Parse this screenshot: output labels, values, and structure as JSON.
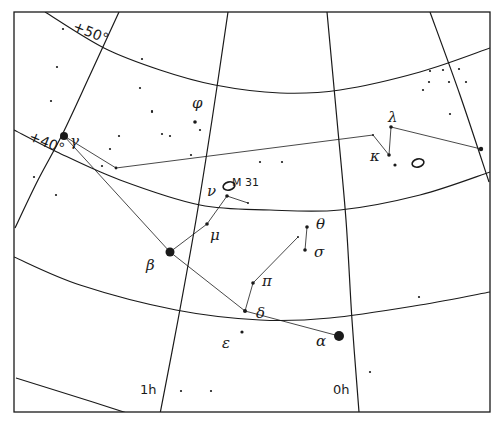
{
  "colors": {
    "ink": "#1a1a1a",
    "background": "#ffffff"
  },
  "frame": {
    "x1": 14,
    "y1": 12,
    "x2": 490,
    "y2": 412
  },
  "ra_lines": [
    {
      "label": "",
      "points": [
        [
          119,
          12
        ],
        [
          90,
          75
        ],
        [
          62,
          135
        ],
        [
          38,
          180
        ],
        [
          15,
          228
        ]
      ]
    },
    {
      "label": "1h",
      "points": [
        [
          228,
          12
        ],
        [
          212,
          120
        ],
        [
          196,
          220
        ],
        [
          178,
          320
        ],
        [
          160,
          414
        ]
      ]
    },
    {
      "label": "0h",
      "points": [
        [
          327,
          12
        ],
        [
          337,
          120
        ],
        [
          346,
          220
        ],
        [
          352,
          320
        ],
        [
          359,
          412
        ]
      ]
    },
    {
      "label": "",
      "points": [
        [
          430,
          12
        ],
        [
          460,
          95
        ],
        [
          489,
          182
        ]
      ]
    }
  ],
  "dec_lines": [
    {
      "label": "+50°",
      "points": [
        [
          45,
          12
        ],
        [
          104,
          48
        ],
        [
          160,
          70
        ],
        [
          215,
          85
        ],
        [
          280,
          93
        ],
        [
          340,
          90
        ],
        [
          420,
          72
        ],
        [
          490,
          48
        ]
      ]
    },
    {
      "label": "+40°",
      "points": [
        [
          14,
          130
        ],
        [
          57,
          152
        ],
        [
          120,
          180
        ],
        [
          200,
          205
        ],
        [
          270,
          210
        ],
        [
          340,
          210
        ],
        [
          420,
          195
        ],
        [
          490,
          172
        ]
      ]
    },
    {
      "label": "",
      "points": [
        [
          14,
          257
        ],
        [
          80,
          285
        ],
        [
          176,
          310
        ],
        [
          260,
          320
        ],
        [
          330,
          318
        ],
        [
          420,
          305
        ],
        [
          490,
          292
        ]
      ]
    },
    {
      "label": "",
      "points": [
        [
          16,
          378
        ],
        [
          80,
          398
        ],
        [
          130,
          414
        ]
      ]
    }
  ],
  "labels": {
    "dec50": {
      "text": "+50°",
      "x": 72,
      "y": 30,
      "rotate": 22
    },
    "dec40": {
      "text": "+40°",
      "x": 28,
      "y": 140,
      "rotate": 22
    },
    "ra1h": {
      "text": "1h",
      "x": 140,
      "y": 394
    },
    "ra0h": {
      "text": "0h",
      "x": 333,
      "y": 394
    },
    "m31": {
      "text": "M 31",
      "x": 232,
      "y": 186
    }
  },
  "stars": [
    {
      "name": "alpha",
      "greek": "α",
      "x": 339,
      "y": 336,
      "r": 5,
      "label_x": 316,
      "label_y": 346
    },
    {
      "name": "beta",
      "greek": "β",
      "x": 170,
      "y": 252,
      "r": 4.5,
      "label_x": 146,
      "label_y": 270
    },
    {
      "name": "gamma",
      "greek": "γ",
      "x": 64,
      "y": 136,
      "r": 4,
      "label_x": 70,
      "label_y": 146
    },
    {
      "name": "delta",
      "greek": "δ",
      "x": 245,
      "y": 311,
      "r": 2,
      "label_x": 256,
      "label_y": 318
    },
    {
      "name": "epsilon",
      "greek": "ε",
      "x": 242,
      "y": 332,
      "r": 1.6,
      "label_x": 222,
      "label_y": 348
    },
    {
      "name": "mu",
      "greek": "μ",
      "x": 207,
      "y": 224,
      "r": 1.8,
      "label_x": 210,
      "label_y": 240
    },
    {
      "name": "nu",
      "greek": "ν",
      "x": 227,
      "y": 196,
      "r": 1.8,
      "label_x": 207,
      "label_y": 196
    },
    {
      "name": "pi",
      "greek": "π",
      "x": 253,
      "y": 283,
      "r": 1.8,
      "label_x": 262,
      "label_y": 286
    },
    {
      "name": "theta",
      "greek": "θ",
      "x": 307,
      "y": 227,
      "r": 1.8,
      "label_x": 316,
      "label_y": 229
    },
    {
      "name": "sigma",
      "greek": "σ",
      "x": 305,
      "y": 250,
      "r": 1.8,
      "label_x": 314,
      "label_y": 257
    },
    {
      "name": "phi",
      "greek": "φ",
      "x": 195,
      "y": 122,
      "r": 1.8,
      "label_x": 192,
      "label_y": 108
    },
    {
      "name": "kappa",
      "greek": "κ",
      "x": 389,
      "y": 155,
      "r": 1.8,
      "label_x": 370,
      "label_y": 161
    },
    {
      "name": "lambda",
      "greek": "λ",
      "x": 391,
      "y": 127,
      "r": 1.8,
      "label_x": 388,
      "label_y": 122
    },
    {
      "name": "iota",
      "greek": "",
      "x": 481,
      "y": 149,
      "r": 2.2
    },
    {
      "name": "kappa-comp",
      "greek": "",
      "x": 395,
      "y": 165,
      "r": 1.6
    },
    {
      "name": "tail",
      "greek": "",
      "x": 373,
      "y": 135,
      "r": 1
    },
    {
      "name": "chain1",
      "greek": "",
      "x": 116,
      "y": 168,
      "r": 1.4
    },
    {
      "name": "nu-end",
      "greek": "",
      "x": 248,
      "y": 203,
      "r": 1
    },
    {
      "name": "pi-top",
      "greek": "",
      "x": 298,
      "y": 237,
      "r": 1
    }
  ],
  "field_stars": [
    [
      63,
      29
    ],
    [
      57,
      67
    ],
    [
      142,
      59
    ],
    [
      140,
      88
    ],
    [
      51,
      101
    ],
    [
      152,
      112
    ],
    [
      162,
      134
    ],
    [
      152,
      111
    ],
    [
      119,
      136
    ],
    [
      110,
      149
    ],
    [
      191,
      155
    ],
    [
      102,
      166
    ],
    [
      34,
      177
    ],
    [
      56,
      195
    ],
    [
      260,
      162
    ],
    [
      282,
      162
    ],
    [
      430,
      71
    ],
    [
      443,
      70
    ],
    [
      459,
      69
    ],
    [
      466,
      82
    ],
    [
      429,
      82
    ],
    [
      449,
      82
    ],
    [
      423,
      90
    ],
    [
      450,
      114
    ],
    [
      419,
      297
    ],
    [
      370,
      372
    ],
    [
      211,
      391
    ],
    [
      181,
      391
    ],
    [
      200,
      130
    ],
    [
      170,
      136
    ]
  ],
  "constellation_lines": [
    [
      [
        64,
        136
      ],
      [
        170,
        252
      ]
    ],
    [
      [
        170,
        252
      ],
      [
        245,
        311
      ]
    ],
    [
      [
        245,
        311
      ],
      [
        339,
        336
      ]
    ],
    [
      [
        170,
        252
      ],
      [
        207,
        224
      ]
    ],
    [
      [
        207,
        224
      ],
      [
        227,
        196
      ]
    ],
    [
      [
        227,
        196
      ],
      [
        248,
        203
      ]
    ],
    [
      [
        245,
        311
      ],
      [
        253,
        283
      ]
    ],
    [
      [
        253,
        283
      ],
      [
        298,
        237
      ]
    ],
    [
      [
        307,
        227
      ],
      [
        305,
        250
      ]
    ],
    [
      [
        64,
        136
      ],
      [
        116,
        168
      ]
    ],
    [
      [
        116,
        168
      ],
      [
        373,
        135
      ]
    ],
    [
      [
        373,
        135
      ],
      [
        389,
        155
      ]
    ],
    [
      [
        389,
        155
      ],
      [
        391,
        127
      ]
    ],
    [
      [
        391,
        127
      ],
      [
        481,
        149
      ]
    ]
  ],
  "nebulae": [
    {
      "name": "M31",
      "cx": 229,
      "cy": 186,
      "rx": 6,
      "ry": 4
    },
    {
      "name": "ngc",
      "cx": 418,
      "cy": 163,
      "rx": 6,
      "ry": 4
    }
  ]
}
